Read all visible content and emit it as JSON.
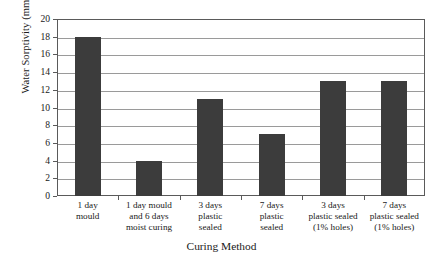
{
  "chart_data": {
    "type": "bar",
    "title": "",
    "xlabel": "Curing Method",
    "ylabel": "Water Sorptivity (mm/h",
    "ylabel_superscript": "0.5",
    "ylabel_suffix": ")",
    "categories": [
      "1 day\nmould",
      "1 day mould\nand 6 days\nmoist curing",
      "3 days\nplastic\nsealed",
      "7 days\nplastic\nsealed",
      "3 days\nplastic sealed\n(1% holes)",
      "7 days\nplastic sealed\n(1% holes)"
    ],
    "category_lines": [
      [
        "1 day",
        "mould"
      ],
      [
        "1 day mould",
        "and 6 days",
        "moist curing"
      ],
      [
        "3 days",
        "plastic",
        "sealed"
      ],
      [
        "7 days",
        "plastic",
        "sealed"
      ],
      [
        "3 days",
        "plastic sealed",
        "(1% holes)"
      ],
      [
        "7 days",
        "plastic sealed",
        "(1% holes)"
      ]
    ],
    "values": [
      18,
      4,
      11,
      7,
      13,
      13
    ],
    "ylim": [
      0,
      20
    ],
    "ytick_values": [
      0,
      2,
      4,
      6,
      8,
      10,
      12,
      14,
      16,
      18,
      20
    ],
    "ytick_labels": [
      "0",
      "2",
      "4",
      "6",
      "8",
      "10",
      "12",
      "14",
      "16",
      "18",
      "20"
    ],
    "grid": true,
    "legend": "none",
    "bar_color": "#3c3c3c",
    "gridline_color": "#9a9a9a",
    "axis_color": "#5a5a5a"
  }
}
